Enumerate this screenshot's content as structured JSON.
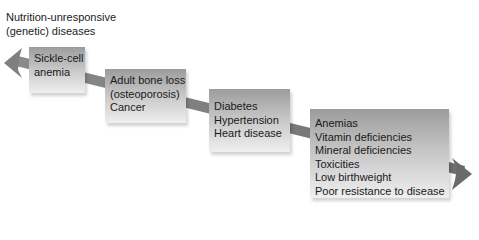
{
  "diagram": {
    "title_line1": "Nutrition-unresponsive",
    "title_line2": "(genetic) diseases",
    "arrow_color": "#7a7a7a",
    "boxes": [
      {
        "lines": [
          "Sickle-cell",
          "anemia"
        ]
      },
      {
        "lines": [
          "Adult bone loss",
          "(osteoporosis)",
          "Cancer"
        ]
      },
      {
        "lines": [
          "Diabetes",
          "Hypertension",
          "Heart disease"
        ]
      },
      {
        "lines": [
          "Anemias",
          "Vitamin deficiencies",
          "Mineral deficiencies",
          "Toxicities",
          "Low birthweight",
          "Poor resistance to disease"
        ]
      }
    ]
  }
}
